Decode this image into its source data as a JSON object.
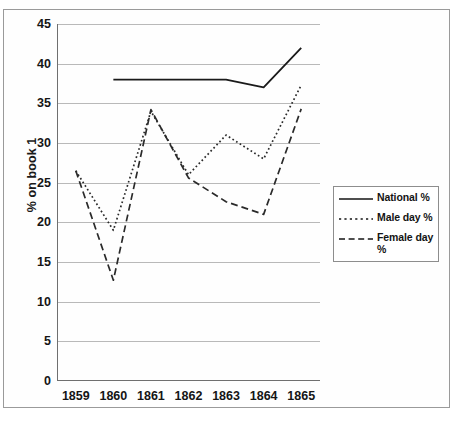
{
  "chart_data": {
    "type": "line",
    "title": "",
    "xlabel": "",
    "ylabel": "% on book 1",
    "categories": [
      "1859",
      "1860",
      "1861",
      "1862",
      "1863",
      "1864",
      "1865"
    ],
    "ylim": [
      0,
      45
    ],
    "ytick_labels": [
      "0",
      "5",
      "10",
      "15",
      "20",
      "25",
      "30",
      "35",
      "40",
      "45"
    ],
    "ytick_values": [
      0,
      5,
      10,
      15,
      20,
      25,
      30,
      35,
      40,
      45
    ],
    "grid": true,
    "legend_position": "right",
    "series": [
      {
        "name": "National %",
        "style": "solid",
        "color": "#1a1a1a",
        "values": [
          null,
          38.0,
          38.0,
          38.0,
          38.0,
          37.0,
          42.0
        ]
      },
      {
        "name": "Male day %",
        "style": "dotted",
        "color": "#2a2a2a",
        "values": [
          26.5,
          19.0,
          34.0,
          26.0,
          31.0,
          28.0,
          37.3
        ]
      },
      {
        "name": "Female day %",
        "style": "dashed",
        "color": "#2a2a2a",
        "values": [
          26.5,
          12.7,
          34.2,
          25.6,
          22.6,
          21.0,
          34.3
        ]
      }
    ]
  },
  "legend": {
    "entries": [
      {
        "label": "National %",
        "icon": "solid-line-icon"
      },
      {
        "label": "Male day %",
        "icon": "dotted-line-icon"
      },
      {
        "label": "Female day %",
        "icon": "dashed-line-icon"
      }
    ]
  }
}
